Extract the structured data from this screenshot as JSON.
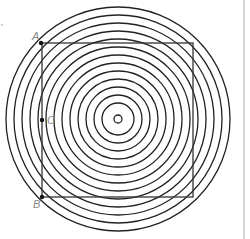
{
  "diagram": {
    "center": {
      "x": 118,
      "y": 119
    },
    "circle_radii": [
      4,
      16,
      24,
      32,
      40,
      48,
      56,
      64,
      72,
      80,
      88,
      96,
      104,
      112
    ],
    "circle_color": "#222222",
    "square": {
      "x": 42,
      "y": 43,
      "width": 151,
      "height": 154,
      "color": "#333333"
    },
    "points": [
      {
        "name": "A",
        "x": 41,
        "y": 43,
        "label_x": 32,
        "label_y": 40
      },
      {
        "name": "B",
        "x": 42,
        "y": 197,
        "label_x": 33,
        "label_y": 208
      },
      {
        "name": "C",
        "x": 42,
        "y": 120,
        "label_x": 47,
        "label_y": 124
      }
    ],
    "labels": {
      "A": "A",
      "B": "B",
      "C": "C"
    },
    "divider_x": 244
  }
}
